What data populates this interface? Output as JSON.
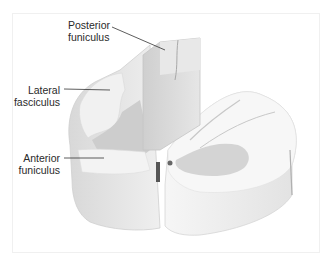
{
  "figure": {
    "labels": [
      {
        "id": "posterior",
        "line1": "Posterior",
        "line2": "funiculus"
      },
      {
        "id": "lateral",
        "line1": "Lateral",
        "line2": "fasciculus"
      },
      {
        "id": "anterior",
        "line1": "Anterior",
        "line2": "funiculus"
      }
    ],
    "colors": {
      "white_matter": "#f2f2f2",
      "white_matter_side": "#dcdcdc",
      "gray_matter": "#cfcfcf",
      "cut_face": "#e4e4e4",
      "shadow": "#9a9a9a",
      "leader_line": "#333333",
      "frame": "#f0f0f0"
    }
  }
}
